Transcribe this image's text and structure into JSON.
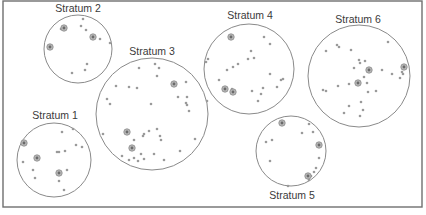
{
  "diagram": {
    "title": "",
    "frame": {
      "x": 3,
      "y": 1,
      "width": 419,
      "height": 206
    },
    "colors": {
      "frame": "#6f6f6f",
      "circle": "#8a8a8a",
      "dot": "#9a9a9a",
      "selected_ring": "#b8b8b8",
      "selected_core": "#6a6a6a",
      "label": "#3a3a3a"
    },
    "strata": [
      {
        "id": "stratum-1",
        "label": "Stratum 1",
        "cx": 54,
        "cy": 160,
        "r": 37,
        "label_x": 55,
        "label_y": 119,
        "points": [
          [
            62,
            132
          ],
          [
            73,
            129
          ],
          [
            57,
            152
          ],
          [
            65,
            151
          ],
          [
            59,
            152
          ],
          [
            82,
            147
          ],
          [
            76,
            145
          ],
          [
            23,
            162
          ],
          [
            33,
            170
          ],
          [
            35,
            178
          ],
          [
            67,
            170
          ],
          [
            59,
            181
          ],
          [
            64,
            190
          ]
        ],
        "selected": [
          [
            24,
            143
          ],
          [
            37,
            158
          ],
          [
            59,
            173
          ]
        ]
      },
      {
        "id": "stratum-2",
        "label": "Stratum 2",
        "cx": 78,
        "cy": 49,
        "r": 34,
        "label_x": 78,
        "label_y": 12,
        "points": [
          [
            83,
            19
          ],
          [
            81,
            26
          ],
          [
            86,
            30
          ],
          [
            100,
            39
          ],
          [
            110,
            43
          ],
          [
            87,
            64
          ],
          [
            85,
            70
          ],
          [
            72,
            73
          ],
          [
            61,
            29
          ]
        ],
        "selected": [
          [
            64,
            28
          ],
          [
            93,
            37
          ],
          [
            50,
            47
          ]
        ]
      },
      {
        "id": "stratum-3",
        "label": "Stratum 3",
        "cx": 152,
        "cy": 114,
        "r": 56,
        "label_x": 152,
        "label_y": 55,
        "points": [
          [
            139,
            68
          ],
          [
            155,
            64
          ],
          [
            159,
            68
          ],
          [
            157,
            76
          ],
          [
            116,
            86
          ],
          [
            129,
            87
          ],
          [
            137,
            88
          ],
          [
            186,
            82
          ],
          [
            178,
            97
          ],
          [
            187,
            97
          ],
          [
            186,
            103
          ],
          [
            187,
            105
          ],
          [
            189,
            111
          ],
          [
            207,
            101
          ],
          [
            107,
            99
          ],
          [
            110,
            104
          ],
          [
            151,
            104
          ],
          [
            103,
            134
          ],
          [
            149,
            131
          ],
          [
            143,
            136
          ],
          [
            144,
            134
          ],
          [
            160,
            136
          ],
          [
            157,
            129
          ],
          [
            161,
            140
          ],
          [
            134,
            140
          ],
          [
            132,
            148
          ],
          [
            141,
            154
          ],
          [
            144,
            159
          ],
          [
            134,
            158
          ],
          [
            129,
            160
          ],
          [
            138,
            161
          ],
          [
            154,
            154
          ],
          [
            164,
            160
          ],
          [
            180,
            151
          ],
          [
            195,
            139
          ],
          [
            122,
            156
          ]
        ],
        "selected": [
          [
            174,
            84
          ],
          [
            127,
            132
          ],
          [
            132,
            148
          ]
        ]
      },
      {
        "id": "stratum-4",
        "label": "Stratum 4",
        "cx": 249,
        "cy": 69,
        "r": 45,
        "label_x": 250,
        "label_y": 19,
        "points": [
          [
            264,
            37
          ],
          [
            270,
            44
          ],
          [
            251,
            51
          ],
          [
            248,
            59
          ],
          [
            254,
            58
          ],
          [
            238,
            64
          ],
          [
            208,
            59
          ],
          [
            206,
            62
          ],
          [
            233,
            67
          ],
          [
            227,
            70
          ],
          [
            219,
            80
          ],
          [
            270,
            74
          ],
          [
            283,
            79
          ],
          [
            281,
            80
          ],
          [
            277,
            87
          ],
          [
            252,
            91
          ],
          [
            263,
            88
          ],
          [
            261,
            94
          ],
          [
            258,
            101
          ],
          [
            232,
            89
          ]
        ],
        "selected": [
          [
            231,
            37
          ],
          [
            225,
            89
          ],
          [
            233,
            92
          ]
        ]
      },
      {
        "id": "stratum-5",
        "label": "Stratum 5",
        "cx": 291,
        "cy": 151,
        "r": 35,
        "label_x": 292,
        "label_y": 199,
        "points": [
          [
            309,
            124
          ],
          [
            302,
            133
          ],
          [
            313,
            132
          ],
          [
            266,
            142
          ],
          [
            272,
            140
          ],
          [
            319,
            158
          ],
          [
            270,
            161
          ],
          [
            316,
            168
          ],
          [
            314,
            172
          ],
          [
            309,
            180
          ],
          [
            288,
            186
          ],
          [
            311,
            176
          ]
        ],
        "selected": [
          [
            282,
            123
          ],
          [
            319,
            145
          ],
          [
            308,
            176
          ]
        ]
      },
      {
        "id": "stratum-6",
        "label": "Stratum 6",
        "cx": 359,
        "cy": 76,
        "r": 51,
        "label_x": 358,
        "label_y": 23,
        "points": [
          [
            388,
            42
          ],
          [
            337,
            45
          ],
          [
            339,
            47
          ],
          [
            351,
            50
          ],
          [
            326,
            51
          ],
          [
            359,
            60
          ],
          [
            360,
            63
          ],
          [
            365,
            61
          ],
          [
            354,
            68
          ],
          [
            382,
            70
          ],
          [
            392,
            74
          ],
          [
            402,
            72
          ],
          [
            403,
            74
          ],
          [
            400,
            78
          ],
          [
            364,
            77
          ],
          [
            367,
            83
          ],
          [
            349,
            84
          ],
          [
            338,
            86
          ],
          [
            323,
            90
          ],
          [
            326,
            91
          ],
          [
            368,
            92
          ],
          [
            376,
            91
          ],
          [
            361,
            102
          ],
          [
            349,
            106
          ],
          [
            363,
            110
          ],
          [
            360,
            116
          ],
          [
            344,
            113
          ]
        ],
        "selected": [
          [
            369,
            70
          ],
          [
            404,
            67
          ],
          [
            358,
            83
          ]
        ]
      }
    ]
  }
}
